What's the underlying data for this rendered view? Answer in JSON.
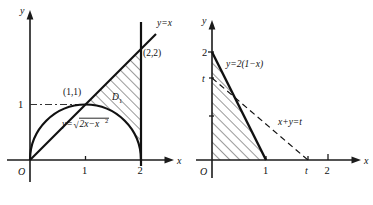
{
  "figure": {
    "background_color": "#ffffff",
    "ink_color": "#111111",
    "panels": [
      {
        "id": "left-panel",
        "name": "region-D1-semicircle-and-line",
        "axes": {
          "x_axis_label": "x",
          "y_axis_label": "y",
          "origin_label": "O",
          "x_ticks": [
            {
              "value": 1,
              "label": "1"
            },
            {
              "value": 2,
              "label": "2"
            }
          ],
          "y_ticks": [
            {
              "value": 1,
              "label": "1"
            }
          ]
        },
        "curves": [
          {
            "name": "line-y-equals-x",
            "label": "y=x",
            "style": "solid"
          },
          {
            "name": "semicircle",
            "label": "y=√2x−x²",
            "label_parts": {
              "lhs": "y=",
              "radical": "√",
              "radicand_a": "2x−x",
              "radicand_exp": "2"
            },
            "style": "solid"
          },
          {
            "name": "vertical-line-x-equals-2",
            "label": "",
            "style": "solid"
          },
          {
            "name": "guide-line-y-equals-1",
            "label": "",
            "style": "dash-dot"
          }
        ],
        "points": [
          {
            "name": "point-1-1",
            "label": "(1,1)"
          },
          {
            "name": "point-2-2",
            "label": "(2,2)"
          }
        ],
        "region": {
          "name": "region-D1",
          "label": "D",
          "label_subscript": "1",
          "fill": "hatched-forward-slash"
        }
      },
      {
        "id": "right-panel",
        "name": "triangle-region-with-line-x-plus-y-equals-t",
        "axes": {
          "x_axis_label": "x",
          "y_axis_label": "y",
          "origin_label": "O",
          "x_ticks": [
            {
              "value": 1,
              "label": "1"
            },
            {
              "value": 1.55,
              "label": "t"
            },
            {
              "value": 2,
              "label": "2"
            }
          ],
          "y_ticks": [
            {
              "value": 2,
              "label": "2"
            },
            {
              "value": 1.55,
              "label": "t"
            }
          ]
        },
        "curves": [
          {
            "name": "line-y-equals-2-1-minus-x",
            "label": "y=2(1−x)",
            "style": "solid"
          },
          {
            "name": "line-x-plus-y-equals-t",
            "label": "x+y=t",
            "style": "dashed"
          }
        ],
        "region": {
          "name": "triangle-region",
          "label": "",
          "fill": "hatched-forward-slash"
        }
      }
    ]
  }
}
